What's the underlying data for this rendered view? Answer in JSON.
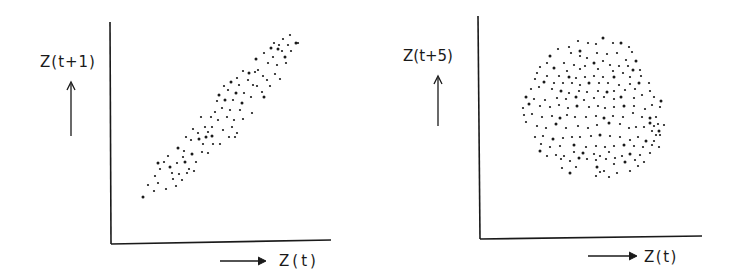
{
  "figure": {
    "background": "#ffffff",
    "ink": "#1a1a1a",
    "panels": [
      {
        "id": "lag1",
        "ylabel": "Z(t+1)",
        "xlabel": "Z(t)",
        "y_arrow": "up",
        "x_arrow": "right"
      },
      {
        "id": "lag5",
        "ylabel": "Z(t+5)",
        "xlabel": "Z(t)",
        "y_arrow": "up",
        "x_arrow": "right"
      }
    ]
  },
  "chart_data": [
    {
      "type": "scatter",
      "title": "",
      "xlabel": "Z(t)",
      "ylabel": "Z(t+1)",
      "grid": false,
      "legend": null,
      "ticks": "none",
      "description": "Lag-1 return map: points lie in a narrow band along a rising diagonal (strong correlation)",
      "pixel_frame": {
        "x0": 110,
        "y0": 243,
        "x1": 331,
        "y1": 22
      },
      "points_px": [
        [
          143,
          197
        ],
        [
          148,
          185
        ],
        [
          154,
          191
        ],
        [
          155,
          176
        ],
        [
          158,
          183
        ],
        [
          158,
          163
        ],
        [
          160,
          169
        ],
        [
          164,
          162
        ],
        [
          166,
          189
        ],
        [
          168,
          156
        ],
        [
          170,
          167
        ],
        [
          172,
          173
        ],
        [
          173,
          179
        ],
        [
          176,
          186
        ],
        [
          177,
          163
        ],
        [
          178,
          148
        ],
        [
          179,
          174
        ],
        [
          182,
          180
        ],
        [
          183,
          157
        ],
        [
          184,
          151
        ],
        [
          185,
          162
        ],
        [
          186,
          137
        ],
        [
          187,
          173
        ],
        [
          189,
          169
        ],
        [
          191,
          140
        ],
        [
          192,
          154
        ],
        [
          193,
          129
        ],
        [
          194,
          171
        ],
        [
          196,
          162
        ],
        [
          198,
          133
        ],
        [
          199,
          139
        ],
        [
          201,
          117
        ],
        [
          202,
          152
        ],
        [
          203,
          144
        ],
        [
          205,
          127
        ],
        [
          206,
          137
        ],
        [
          208,
          153
        ],
        [
          208,
          132
        ],
        [
          211,
          117
        ],
        [
          212,
          127
        ],
        [
          212,
          136
        ],
        [
          213,
          144
        ],
        [
          215,
          112
        ],
        [
          217,
          101
        ],
        [
          218,
          120
        ],
        [
          219,
          95
        ],
        [
          220,
          144
        ],
        [
          222,
          108
        ],
        [
          223,
          130
        ],
        [
          224,
          86
        ],
        [
          225,
          100
        ],
        [
          227,
          117
        ],
        [
          228,
          90
        ],
        [
          229,
          137
        ],
        [
          230,
          110
        ],
        [
          231,
          82
        ],
        [
          232,
          127
        ],
        [
          233,
          100
        ],
        [
          234,
          120
        ],
        [
          235,
          137
        ],
        [
          236,
          93
        ],
        [
          237,
          78
        ],
        [
          237,
          133
        ],
        [
          239,
          85
        ],
        [
          240,
          110
        ],
        [
          242,
          103
        ],
        [
          243,
          71
        ],
        [
          243,
          119
        ],
        [
          244,
          93
        ],
        [
          248,
          80
        ],
        [
          249,
          73
        ],
        [
          251,
          97
        ],
        [
          252,
          113
        ],
        [
          253,
          85
        ],
        [
          255,
          72
        ],
        [
          256,
          59
        ],
        [
          257,
          86
        ],
        [
          258,
          70
        ],
        [
          262,
          92
        ],
        [
          263,
          76
        ],
        [
          264,
          97
        ],
        [
          264,
          53
        ],
        [
          267,
          80
        ],
        [
          268,
          63
        ],
        [
          270,
          86
        ],
        [
          271,
          48
        ],
        [
          273,
          57
        ],
        [
          274,
          43
        ],
        [
          275,
          74
        ],
        [
          277,
          65
        ],
        [
          278,
          49
        ],
        [
          279,
          45
        ],
        [
          280,
          79
        ],
        [
          282,
          51
        ],
        [
          283,
          39
        ],
        [
          285,
          57
        ],
        [
          286,
          63
        ],
        [
          288,
          45
        ],
        [
          290,
          35
        ],
        [
          291,
          51
        ],
        [
          296,
          43
        ],
        [
          298,
          43
        ]
      ]
    },
    {
      "type": "scatter",
      "title": "",
      "xlabel": "Z(t)",
      "ylabel": "Z(t+5)",
      "grid": false,
      "legend": null,
      "ticks": "none",
      "description": "Lag-5 return map: points fill a roughly circular cloud (no apparent correlation)",
      "pixel_frame": {
        "x0": 479,
        "y0": 239,
        "x1": 702,
        "y1": 16
      },
      "points_px": [
        [
          603,
          38
        ],
        [
          578,
          41
        ],
        [
          588,
          43
        ],
        [
          596,
          44
        ],
        [
          613,
          43
        ],
        [
          621,
          43
        ],
        [
          629,
          47
        ],
        [
          569,
          47
        ],
        [
          558,
          49
        ],
        [
          571,
          53
        ],
        [
          580,
          51
        ],
        [
          597,
          53
        ],
        [
          607,
          54
        ],
        [
          617,
          53
        ],
        [
          632,
          52
        ],
        [
          550,
          56
        ],
        [
          580,
          56
        ],
        [
          587,
          58
        ],
        [
          603,
          61
        ],
        [
          626,
          60
        ],
        [
          636,
          61
        ],
        [
          547,
          63
        ],
        [
          564,
          63
        ],
        [
          574,
          65
        ],
        [
          585,
          66
        ],
        [
          594,
          63
        ],
        [
          610,
          65
        ],
        [
          619,
          66
        ],
        [
          628,
          66
        ],
        [
          540,
          67
        ],
        [
          554,
          68
        ],
        [
          567,
          71
        ],
        [
          580,
          69
        ],
        [
          598,
          69
        ],
        [
          613,
          71
        ],
        [
          633,
          70
        ],
        [
          640,
          70
        ],
        [
          537,
          73
        ],
        [
          547,
          76
        ],
        [
          559,
          76
        ],
        [
          569,
          77
        ],
        [
          576,
          78
        ],
        [
          585,
          77
        ],
        [
          594,
          76
        ],
        [
          603,
          77
        ],
        [
          614,
          77
        ],
        [
          623,
          73
        ],
        [
          630,
          77
        ],
        [
          641,
          76
        ],
        [
          535,
          79
        ],
        [
          544,
          82
        ],
        [
          554,
          83
        ],
        [
          563,
          83
        ],
        [
          572,
          83
        ],
        [
          580,
          85
        ],
        [
          589,
          83
        ],
        [
          599,
          83
        ],
        [
          608,
          83
        ],
        [
          619,
          85
        ],
        [
          630,
          84
        ],
        [
          639,
          83
        ],
        [
          649,
          83
        ],
        [
          531,
          89
        ],
        [
          539,
          87
        ],
        [
          552,
          89
        ],
        [
          561,
          91
        ],
        [
          569,
          93
        ],
        [
          579,
          91
        ],
        [
          587,
          92
        ],
        [
          598,
          91
        ],
        [
          607,
          92
        ],
        [
          614,
          91
        ],
        [
          625,
          90
        ],
        [
          635,
          89
        ],
        [
          650,
          91
        ],
        [
          526,
          97
        ],
        [
          534,
          99
        ],
        [
          545,
          100
        ],
        [
          557,
          98
        ],
        [
          566,
          99
        ],
        [
          576,
          97
        ],
        [
          584,
          100
        ],
        [
          594,
          98
        ],
        [
          604,
          97
        ],
        [
          614,
          99
        ],
        [
          621,
          97
        ],
        [
          634,
          98
        ],
        [
          642,
          95
        ],
        [
          654,
          97
        ],
        [
          523,
          108
        ],
        [
          529,
          104
        ],
        [
          540,
          106
        ],
        [
          550,
          107
        ],
        [
          559,
          105
        ],
        [
          568,
          108
        ],
        [
          577,
          106
        ],
        [
          589,
          107
        ],
        [
          598,
          106
        ],
        [
          605,
          108
        ],
        [
          614,
          107
        ],
        [
          624,
          106
        ],
        [
          634,
          106
        ],
        [
          645,
          109
        ],
        [
          652,
          105
        ],
        [
          660,
          107
        ],
        [
          661,
          101
        ],
        [
          524,
          115
        ],
        [
          532,
          114
        ],
        [
          542,
          117
        ],
        [
          552,
          116
        ],
        [
          560,
          118
        ],
        [
          567,
          115
        ],
        [
          575,
          117
        ],
        [
          586,
          117
        ],
        [
          596,
          116
        ],
        [
          604,
          118
        ],
        [
          613,
          116
        ],
        [
          623,
          117
        ],
        [
          633,
          113
        ],
        [
          642,
          117
        ],
        [
          650,
          118
        ],
        [
          656,
          117
        ],
        [
          526,
          122
        ],
        [
          537,
          126
        ],
        [
          546,
          128
        ],
        [
          556,
          124
        ],
        [
          566,
          128
        ],
        [
          578,
          126
        ],
        [
          588,
          128
        ],
        [
          597,
          125
        ],
        [
          609,
          123
        ],
        [
          620,
          124
        ],
        [
          629,
          128
        ],
        [
          636,
          127
        ],
        [
          644,
          127
        ],
        [
          650,
          123
        ],
        [
          654,
          126
        ],
        [
          658,
          124
        ],
        [
          664,
          125
        ],
        [
          652,
          131
        ],
        [
          659,
          131
        ],
        [
          660,
          135
        ],
        [
          656,
          135
        ],
        [
          535,
          137
        ],
        [
          543,
          136
        ],
        [
          553,
          139
        ],
        [
          563,
          138
        ],
        [
          572,
          137
        ],
        [
          580,
          137
        ],
        [
          591,
          136
        ],
        [
          600,
          135
        ],
        [
          610,
          136
        ],
        [
          620,
          137
        ],
        [
          630,
          140
        ],
        [
          638,
          137
        ],
        [
          646,
          141
        ],
        [
          654,
          141
        ],
        [
          541,
          144
        ],
        [
          550,
          147
        ],
        [
          560,
          146
        ],
        [
          574,
          145
        ],
        [
          586,
          147
        ],
        [
          596,
          146
        ],
        [
          605,
          147
        ],
        [
          614,
          146
        ],
        [
          624,
          145
        ],
        [
          634,
          146
        ],
        [
          643,
          147
        ],
        [
          652,
          145
        ],
        [
          659,
          147
        ],
        [
          540,
          151
        ],
        [
          547,
          156
        ],
        [
          556,
          155
        ],
        [
          564,
          156
        ],
        [
          574,
          152
        ],
        [
          583,
          153
        ],
        [
          594,
          154
        ],
        [
          600,
          156
        ],
        [
          609,
          152
        ],
        [
          622,
          156
        ],
        [
          630,
          154
        ],
        [
          640,
          155
        ],
        [
          650,
          153
        ],
        [
          561,
          159
        ],
        [
          570,
          161
        ],
        [
          579,
          158
        ],
        [
          587,
          159
        ],
        [
          596,
          160
        ],
        [
          606,
          159
        ],
        [
          615,
          158
        ],
        [
          625,
          162
        ],
        [
          635,
          160
        ],
        [
          644,
          162
        ],
        [
          562,
          168
        ],
        [
          576,
          167
        ],
        [
          597,
          167
        ],
        [
          604,
          171
        ],
        [
          614,
          164
        ],
        [
          630,
          171
        ],
        [
          638,
          166
        ],
        [
          570,
          173
        ],
        [
          596,
          176
        ],
        [
          609,
          177
        ],
        [
          617,
          173
        ],
        [
          600,
          172
        ]
      ]
    }
  ]
}
